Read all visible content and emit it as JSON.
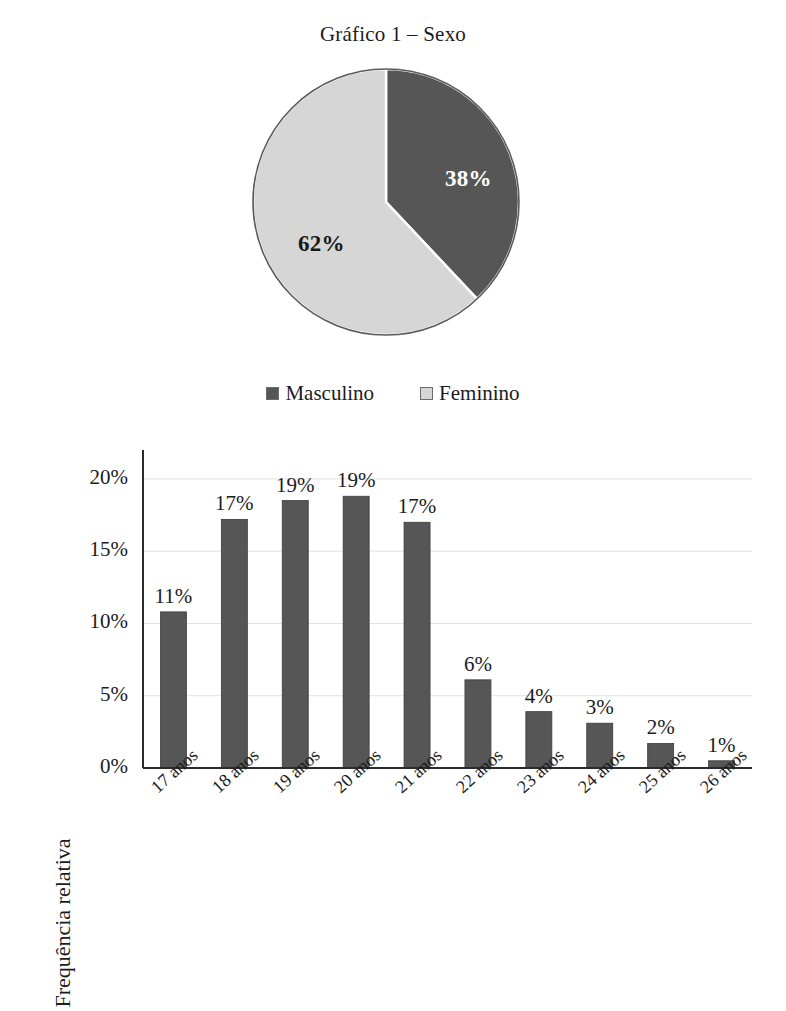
{
  "pie": {
    "title": "Gráfico 1 – Sexo",
    "legend": [
      {
        "label": "Masculino",
        "color": "#565656"
      },
      {
        "label": "Feminino",
        "color": "#d6d6d6"
      }
    ],
    "slice_labels": {
      "masculino": "38%",
      "feminino": "62%"
    }
  },
  "bar": {
    "ylabel": "Frequência relativa"
  },
  "chart_data": [
    {
      "type": "pie",
      "title": "Gráfico 1 – Sexo",
      "categories": [
        "Masculino",
        "Feminino"
      ],
      "values": [
        38,
        62
      ],
      "value_labels": [
        "38%",
        "62%"
      ],
      "colors": [
        "#565656",
        "#d6d6d6"
      ],
      "legend_position": "bottom",
      "start_angle_deg": 0,
      "direction": "clockwise",
      "units": "percent"
    },
    {
      "type": "bar",
      "title": "",
      "xlabel": "",
      "ylabel": "Frequência relativa",
      "categories": [
        "17 anos",
        "18 anos",
        "19 anos",
        "20 anos",
        "21 anos",
        "22 anos",
        "23 anos",
        "24 anos",
        "25 anos",
        "26 anos"
      ],
      "values": [
        10.8,
        17.2,
        18.5,
        18.8,
        17.0,
        6.1,
        3.9,
        3.1,
        1.7,
        0.5
      ],
      "value_labels": [
        "11%",
        "17%",
        "19%",
        "19%",
        "17%",
        "6%",
        "4%",
        "3%",
        "2%",
        "1%"
      ],
      "yticks": [
        0,
        5,
        10,
        15,
        20
      ],
      "ytick_labels": [
        "0%",
        "5%",
        "10%",
        "15%",
        "20%"
      ],
      "ylim": [
        0,
        22
      ],
      "grid": "horizontal",
      "bar_color": "#565656",
      "units": "percent"
    }
  ]
}
